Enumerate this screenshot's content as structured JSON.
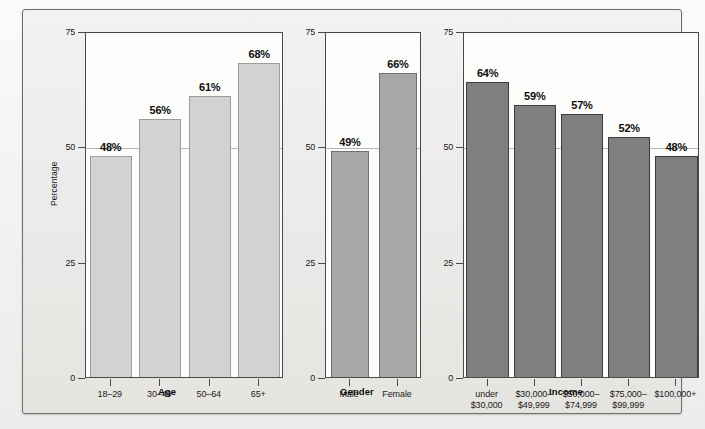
{
  "chart_data": {
    "type": "bar",
    "title": "",
    "ylabel": "Percentage",
    "ylim": [
      0,
      75
    ],
    "yticks": [
      0,
      25,
      50,
      75
    ],
    "grid": "horizontal gridline at 50",
    "legend": "none",
    "panels": [
      {
        "id": "age",
        "xlabel": "Age",
        "categories": [
          "18–29",
          "30–49",
          "50–64",
          "65+"
        ],
        "values": [
          48,
          56,
          61,
          68
        ],
        "value_labels": [
          "48%",
          "56%",
          "61%",
          "68%"
        ],
        "bar_color": "#d2d2d0"
      },
      {
        "id": "gender",
        "xlabel": "Gender",
        "categories": [
          "Male",
          "Female"
        ],
        "values": [
          49,
          66
        ],
        "value_labels": [
          "49%",
          "66%"
        ],
        "bar_color": "#a7a7a5"
      },
      {
        "id": "income",
        "xlabel": "Income",
        "categories": [
          "under\n$30,000",
          "$30,000–\n$49,999",
          "$50,000–\n$74,999",
          "$75,000–\n$99,999",
          "$100,000+"
        ],
        "category_lines": [
          [
            "under",
            "$30,000"
          ],
          [
            "$30,000–",
            "$49,999"
          ],
          [
            "$50,000–",
            "$74,999"
          ],
          [
            "$75,000–",
            "$99,999"
          ],
          [
            "$100,000+",
            ""
          ]
        ],
        "values": [
          64,
          59,
          57,
          52,
          48
        ],
        "value_labels": [
          "64%",
          "59%",
          "57%",
          "52%",
          "48%"
        ],
        "bar_color": "#7f7f7d"
      }
    ]
  },
  "axis": {
    "ylabel": "Percentage",
    "ytick_labels": [
      "75",
      "50",
      "25",
      "0"
    ]
  }
}
